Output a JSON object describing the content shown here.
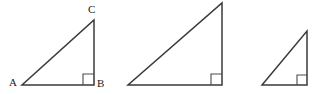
{
  "figure": {
    "background_color": "#ffffff",
    "stroke_color": "#3a3a3a",
    "label_color": "#222222",
    "marker_color": "#4a4a4a",
    "width": 322,
    "height": 94
  },
  "triangles": [
    {
      "id": "triangle-1",
      "labeled": true,
      "vertices": {
        "A": {
          "label": "A",
          "x": 22,
          "y": 85
        },
        "B": {
          "label": "B",
          "x": 94,
          "y": 85
        },
        "C": {
          "label": "C",
          "x": 94,
          "y": 20
        }
      },
      "right_angle_at": "B",
      "path": "M 22 85 L 94 85 L 94 20 Z",
      "marker_path": "M 83 85 L 83 74 L 94 74"
    },
    {
      "id": "triangle-2",
      "labeled": false,
      "vertices": {
        "A": {
          "label": "",
          "x": 128,
          "y": 85
        },
        "B": {
          "label": "",
          "x": 222,
          "y": 85
        },
        "C": {
          "label": "",
          "x": 222,
          "y": 3
        }
      },
      "right_angle_at": "B",
      "path": "M 128 85 L 222 85 L 222 3 Z",
      "marker_path": "M 211 85 L 211 74 L 222 74"
    },
    {
      "id": "triangle-3",
      "labeled": false,
      "vertices": {
        "A": {
          "label": "",
          "x": 262,
          "y": 85
        },
        "B": {
          "label": "",
          "x": 307,
          "y": 85
        },
        "C": {
          "label": "",
          "x": 307,
          "y": 31
        }
      },
      "right_angle_at": "B",
      "path": "M 262 85 L 307 85 L 307 31 Z",
      "marker_path": "M 297 85 L 297 75 L 307 75"
    }
  ],
  "labels": {
    "A": "A",
    "B": "B",
    "C": "C"
  }
}
